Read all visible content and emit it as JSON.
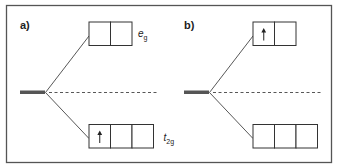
{
  "figure": {
    "panels": [
      {
        "label": "a)",
        "upper_level": {
          "name": "e",
          "subscript": "g",
          "orbitals": 2,
          "electrons": [
            0,
            0
          ]
        },
        "lower_level": {
          "name": "t",
          "subscript": "2g",
          "orbitals": 3,
          "electrons": [
            1,
            0,
            0
          ]
        },
        "show_upper_label": true,
        "show_lower_label": true
      },
      {
        "label": "b)",
        "upper_level": {
          "name": "e",
          "subscript": "g",
          "orbitals": 2,
          "electrons": [
            1,
            0
          ]
        },
        "lower_level": {
          "name": "t",
          "subscript": "2g",
          "orbitals": 3,
          "electrons": [
            0,
            0,
            0
          ]
        },
        "show_upper_label": false,
        "show_lower_label": false
      }
    ],
    "electron_symbol": "↑",
    "colors": {
      "line": "#444444",
      "bar": "#555555",
      "frame": "#555555"
    }
  }
}
